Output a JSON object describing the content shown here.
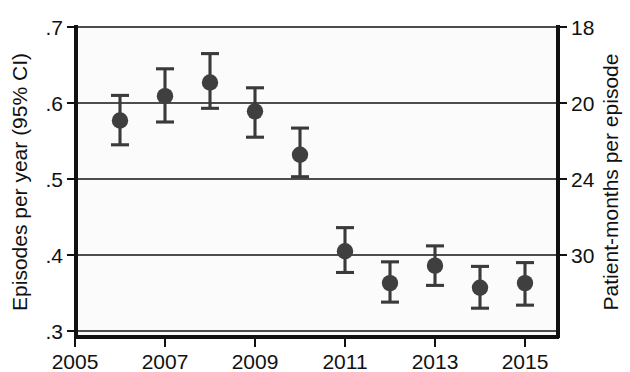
{
  "chart_data": {
    "type": "scatter",
    "title": "",
    "xlabel": "",
    "ylabel": "Episodes per year (95% CI)",
    "y2label": "Patient-months per episode",
    "grid": true,
    "legend": null,
    "xlim": [
      2005,
      2015.6
    ],
    "ylim": [
      0.3,
      0.7
    ],
    "xticks": [
      "2005",
      "2007",
      "2009",
      "2011",
      "2013",
      "2015"
    ],
    "xtick_values": [
      2005,
      2007,
      2009,
      2011,
      2013,
      2015
    ],
    "yticks": [
      ".7",
      ".6",
      ".5",
      ".4",
      ".3"
    ],
    "ytick_values": [
      0.7,
      0.6,
      0.5,
      0.4,
      0.3
    ],
    "y2ticks": [
      "18",
      "20",
      "24",
      "30"
    ],
    "y2tick_at_y": [
      0.7,
      0.6,
      0.5,
      0.4
    ],
    "x": [
      2006,
      2007,
      2008,
      2009,
      2010,
      2011,
      2012,
      2013,
      2014,
      2015
    ],
    "values": [
      0.577,
      0.609,
      0.627,
      0.589,
      0.532,
      0.405,
      0.363,
      0.386,
      0.357,
      0.363
    ],
    "ci_low": [
      0.545,
      0.575,
      0.593,
      0.555,
      0.503,
      0.377,
      0.338,
      0.36,
      0.33,
      0.334
    ],
    "ci_high": [
      0.61,
      0.645,
      0.665,
      0.62,
      0.567,
      0.436,
      0.391,
      0.412,
      0.385,
      0.39
    ],
    "points": [
      {
        "year": 2006,
        "value": 0.577,
        "ci_low": 0.545,
        "ci_high": 0.61
      },
      {
        "year": 2007,
        "value": 0.609,
        "ci_low": 0.575,
        "ci_high": 0.645
      },
      {
        "year": 2008,
        "value": 0.627,
        "ci_low": 0.593,
        "ci_high": 0.665
      },
      {
        "year": 2009,
        "value": 0.589,
        "ci_low": 0.555,
        "ci_high": 0.62
      },
      {
        "year": 2010,
        "value": 0.532,
        "ci_low": 0.503,
        "ci_high": 0.567
      },
      {
        "year": 2011,
        "value": 0.405,
        "ci_low": 0.377,
        "ci_high": 0.436
      },
      {
        "year": 2012,
        "value": 0.363,
        "ci_low": 0.338,
        "ci_high": 0.391
      },
      {
        "year": 2013,
        "value": 0.386,
        "ci_low": 0.36,
        "ci_high": 0.412
      },
      {
        "year": 2014,
        "value": 0.357,
        "ci_low": 0.33,
        "ci_high": 0.385
      },
      {
        "year": 2015,
        "value": 0.363,
        "ci_low": 0.334,
        "ci_high": 0.39
      }
    ],
    "marker_color": "#3f3f3f",
    "grid_color": "#4d4d4d",
    "axis_color": "#111111",
    "background_color": "#fbfbfb"
  }
}
